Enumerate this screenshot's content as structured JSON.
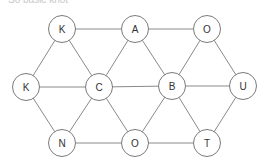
{
  "caption": "So basic knot",
  "graph": {
    "node_radius": 13.5,
    "nodes": [
      {
        "id": "n1",
        "label": "K",
        "x": 62,
        "y": 29
      },
      {
        "id": "n2",
        "label": "A",
        "x": 135,
        "y": 29
      },
      {
        "id": "n3",
        "label": "O",
        "x": 207,
        "y": 29
      },
      {
        "id": "n4",
        "label": "K",
        "x": 26,
        "y": 87
      },
      {
        "id": "n5",
        "label": "C",
        "x": 99,
        "y": 87
      },
      {
        "id": "n6",
        "label": "B",
        "x": 172,
        "y": 86
      },
      {
        "id": "n7",
        "label": "U",
        "x": 243,
        "y": 86
      },
      {
        "id": "n8",
        "label": "N",
        "x": 62,
        "y": 143
      },
      {
        "id": "n9",
        "label": "O",
        "x": 135,
        "y": 143
      },
      {
        "id": "n10",
        "label": "T",
        "x": 207,
        "y": 143
      }
    ],
    "edges": [
      [
        "n1",
        "n2"
      ],
      [
        "n2",
        "n3"
      ],
      [
        "n4",
        "n5"
      ],
      [
        "n5",
        "n6"
      ],
      [
        "n6",
        "n7"
      ],
      [
        "n8",
        "n9"
      ],
      [
        "n9",
        "n10"
      ],
      [
        "n1",
        "n4"
      ],
      [
        "n1",
        "n5"
      ],
      [
        "n2",
        "n5"
      ],
      [
        "n2",
        "n6"
      ],
      [
        "n3",
        "n6"
      ],
      [
        "n3",
        "n7"
      ],
      [
        "n4",
        "n8"
      ],
      [
        "n5",
        "n8"
      ],
      [
        "n5",
        "n9"
      ],
      [
        "n6",
        "n9"
      ],
      [
        "n6",
        "n10"
      ],
      [
        "n7",
        "n10"
      ]
    ]
  }
}
